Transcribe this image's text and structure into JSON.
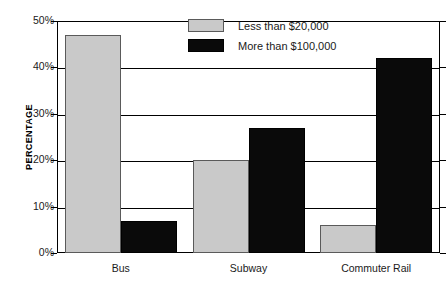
{
  "chart_data": {
    "type": "bar",
    "title": "",
    "xlabel": "",
    "ylabel": "PERCENTAGE",
    "categories": [
      "Bus",
      "Subway",
      "Commuter Rail"
    ],
    "series": [
      {
        "name": "Less than $20,000",
        "color": "#c9c9c9",
        "values": [
          47,
          20,
          6
        ]
      },
      {
        "name": "More than $100,000",
        "color": "#0a0a0a",
        "values": [
          7,
          27,
          42
        ]
      }
    ],
    "ylim": [
      0,
      50
    ],
    "yticks": [
      0,
      10,
      20,
      30,
      40,
      50
    ],
    "ytick_labels": [
      "0%",
      "10%",
      "20%",
      "30%",
      "40%",
      "50%"
    ],
    "grid": true,
    "legend_position": "top-center",
    "value_suffix": "%"
  },
  "axis": {
    "y_title": "PERCENTAGE"
  },
  "legend": {
    "items": [
      {
        "label": "Less than $20,000"
      },
      {
        "label": "More than $100,000"
      }
    ]
  },
  "top_caption": ""
}
